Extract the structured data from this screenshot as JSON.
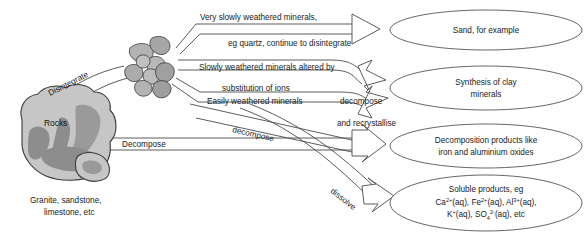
{
  "diagram": {
    "source_node": {
      "label": "Rocks",
      "caption_line1": "Granite, sandstone,",
      "caption_line2": "limestone, etc"
    },
    "process_labels": {
      "disintegrate": "Disintegrate",
      "decompose_main": "Decompose",
      "decompose_diagonal": "decompose",
      "dissolve_diagonal": "dissolve",
      "decompose_inline": "decompose"
    },
    "path_labels": [
      {
        "id": "very-slowly-weathered",
        "text": "Very slowly weathered minerals,"
      },
      {
        "id": "eg-quartz",
        "text": "eg quartz, continue to disintegrate"
      },
      {
        "id": "slowly-weathered",
        "text": "Slowly weathered minerals altered by"
      },
      {
        "id": "substitution-of-ions",
        "text": "substitution of ions"
      },
      {
        "id": "easily-weathered",
        "text": "Easily weathered minerals"
      },
      {
        "id": "and-recrystallise",
        "text": "and recrystallise"
      }
    ],
    "outcomes": [
      {
        "id": "sand",
        "lines": [
          "Sand, for example"
        ]
      },
      {
        "id": "clay-minerals",
        "lines": [
          "Synthesis of clay",
          "minerals"
        ]
      },
      {
        "id": "decomposition-products",
        "lines": [
          "Decomposition products like",
          "iron and aluminium oxides"
        ]
      },
      {
        "id": "soluble-products",
        "lines": [
          "Soluble products, eg",
          "K  (aq), SO  (aq), etc"
        ],
        "ions_line": {
          "ca": {
            "symbol": "Ca",
            "charge": "2+",
            "state": "(aq),"
          },
          "fe": {
            "symbol": "Fe",
            "charge": "2+",
            "state": "(aq),"
          },
          "al": {
            "symbol": "Al",
            "charge": "3+",
            "state": "(aq),"
          },
          "k": {
            "symbol": "K",
            "charge": "+",
            "state": "(aq),"
          },
          "so4": {
            "symbol": "SO",
            "subscript": "4",
            "charge": "2-",
            "state": "(aq), etc"
          }
        },
        "line1": "Soluble products, eg"
      }
    ],
    "colors": {
      "line": "#4a4a4a",
      "text": "#1a1a1a",
      "rock_light": "#c9c9c9",
      "rock_mid": "#a8a8a8",
      "rock_dark": "#8a8a8a",
      "background": "#ffffff"
    }
  }
}
